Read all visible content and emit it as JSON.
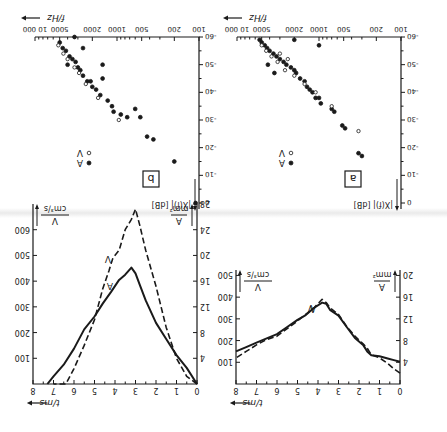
{
  "figure": {
    "orientation": "rotated 180 degrees",
    "background": "#ffffff",
    "ink": "#1a1a1a"
  },
  "chart_data": [
    {
      "id": "time-left",
      "type": "line",
      "panel_position_upright": "top-left",
      "xlabel": "t/ms",
      "x_ticks": [
        0,
        1,
        2,
        3,
        4,
        5,
        6,
        7,
        8
      ],
      "xlim": [
        0,
        8
      ],
      "y_left_label": "A / mm²",
      "y_left_ticks": [
        4,
        8,
        12,
        16,
        20
      ],
      "y_left_lim": [
        0,
        21
      ],
      "y_right_label": "V / cm³/s",
      "y_right_ticks": [
        100,
        200,
        300,
        400,
        500
      ],
      "y_right_lim": [
        0,
        525
      ],
      "series": [
        {
          "name": "A",
          "style": "solid",
          "x": [
            0,
            0.3,
            0.6,
            1,
            1.4,
            1.6,
            1.8,
            2.2,
            2.6,
            3.0,
            3.4,
            3.6,
            3.8,
            4.2,
            4.6,
            5,
            5.5,
            6,
            6.5,
            7,
            7.5,
            8
          ],
          "y": [
            4.1,
            4.4,
            4.7,
            5.1,
            5.3,
            6,
            7.2,
            8.5,
            10.5,
            12.6,
            13.6,
            14.8,
            15,
            14,
            12.7,
            11.8,
            10.5,
            9.2,
            8.4,
            7.6,
            6.8,
            6.0
          ]
        },
        {
          "name": "V",
          "style": "dashed",
          "x": [
            0,
            0.3,
            0.6,
            1,
            1.4,
            1.6,
            1.8,
            2.2,
            2.6,
            3.0,
            3.4,
            3.6,
            3.8,
            4.2,
            4.6,
            5,
            5.5,
            6,
            6.5,
            7,
            7.5,
            8
          ],
          "y": [
            50,
            70,
            95,
            120,
            135,
            165,
            185,
            220,
            265,
            320,
            350,
            375,
            390,
            350,
            320,
            290,
            255,
            220,
            205,
            180,
            150,
            120
          ]
        }
      ],
      "legend": [
        "A",
        "V"
      ]
    },
    {
      "id": "time-right",
      "type": "line",
      "panel_position_upright": "top-right",
      "xlabel": "t/ms",
      "x_ticks": [
        0,
        1,
        2,
        3,
        4,
        5,
        6,
        7,
        8
      ],
      "xlim": [
        0,
        8
      ],
      "y_left_label": "A / mm²",
      "y_left_ticks": [
        4,
        8,
        12,
        16,
        20,
        24,
        28
      ],
      "y_left_lim": [
        0,
        28
      ],
      "y_right_label": "V / cm³/s",
      "y_right_ticks": [
        100,
        200,
        300,
        400,
        500,
        600
      ],
      "y_right_lim": [
        0,
        700
      ],
      "series": [
        {
          "name": "A",
          "style": "solid",
          "x": [
            0,
            0.5,
            1,
            1.5,
            2,
            2.5,
            2.8,
            3.0,
            3.2,
            3.5,
            3.8,
            4.2,
            4.6,
            5,
            5.5,
            6,
            6.5,
            7,
            7.3
          ],
          "y": [
            0,
            2.5,
            4.5,
            7,
            9.5,
            13,
            15.5,
            17.2,
            18.1,
            17,
            16.2,
            14.3,
            12.5,
            10.5,
            8.5,
            5.5,
            3,
            1.2,
            0
          ]
        },
        {
          "name": "V",
          "style": "dashed",
          "x": [
            0,
            0.5,
            1,
            1.5,
            2,
            2.5,
            2.8,
            3.0,
            3.2,
            3.5,
            3.8,
            4.1,
            4.3,
            4.6,
            5,
            5.5,
            6,
            6.4,
            7
          ],
          "y": [
            0,
            30,
            100,
            220,
            380,
            520,
            620,
            680,
            640,
            600,
            520,
            490,
            440,
            370,
            250,
            150,
            60,
            0,
            0
          ]
        }
      ],
      "legend": [
        "A",
        "V"
      ]
    },
    {
      "id": "spectrum-a",
      "type": "scatter",
      "panel_label": "a",
      "panel_position_upright": "bottom-left",
      "xlabel": "f/Hz",
      "xscale": "log",
      "x_ticks": [
        100,
        200,
        500,
        1000,
        2000,
        5000,
        10000
      ],
      "xlim": [
        100,
        10000
      ],
      "ylabel": "|X(f)| [dB]",
      "y_ticks": [
        0,
        -10,
        -20,
        -30,
        -40,
        -50,
        -60
      ],
      "ylim": [
        0,
        -60
      ],
      "legend": [
        {
          "marker": "filled",
          "label": "A"
        },
        {
          "marker": "open",
          "label": "V"
        }
      ],
      "series": [
        {
          "name": "A",
          "marker": "filled",
          "points": [
            [
              300,
              -17
            ],
            [
              330,
              -18
            ],
            [
              480,
              -27
            ],
            [
              520,
              -28
            ],
            [
              650,
              -33
            ],
            [
              700,
              -34
            ],
            [
              950,
              -36
            ],
            [
              1000,
              -38
            ],
            [
              1100,
              -38
            ],
            [
              1200,
              -40
            ],
            [
              1300,
              -41
            ],
            [
              1400,
              -42
            ],
            [
              1500,
              -44
            ],
            [
              1700,
              -45
            ],
            [
              1900,
              -47
            ],
            [
              2000,
              -48
            ],
            [
              2200,
              -49
            ],
            [
              2500,
              -50
            ],
            [
              2700,
              -51
            ],
            [
              3000,
              -52
            ],
            [
              3300,
              -53
            ],
            [
              3600,
              -54
            ],
            [
              4000,
              -55
            ],
            [
              4300,
              -56
            ],
            [
              4600,
              -57
            ],
            [
              5000,
              -58
            ],
            [
              5300,
              -59
            ],
            [
              1000,
              -57
            ],
            [
              2000,
              -59
            ],
            [
              4200,
              -50
            ],
            [
              3500,
              -47
            ]
          ]
        },
        {
          "name": "V",
          "marker": "open",
          "points": [
            [
              330,
              -26
            ],
            [
              700,
              -35
            ],
            [
              1100,
              -40
            ],
            [
              1500,
              -43
            ],
            [
              2000,
              -46
            ],
            [
              2600,
              -48
            ],
            [
              3200,
              -51
            ],
            [
              3800,
              -53
            ],
            [
              4400,
              -55
            ],
            [
              5000,
              -57
            ],
            [
              3000,
              -54
            ],
            [
              2400,
              -52
            ]
          ]
        }
      ]
    },
    {
      "id": "spectrum-b",
      "type": "scatter",
      "panel_label": "b",
      "panel_position_upright": "bottom-right",
      "xlabel": "f/Hz",
      "xscale": "log",
      "x_ticks": [
        100,
        200,
        500,
        1000,
        2000,
        5000,
        10000
      ],
      "xlim": [
        100,
        10000
      ],
      "ylabel": "|X(f)| [dB]",
      "y_ticks": [
        0,
        -10,
        -20,
        -30,
        -40,
        -50,
        -60
      ],
      "ylim": [
        0,
        -60
      ],
      "legend": [
        {
          "marker": "filled",
          "label": "A"
        },
        {
          "marker": "open",
          "label": "V"
        }
      ],
      "series": [
        {
          "name": "A",
          "marker": "filled",
          "points": [
            [
              110,
              0
            ],
            [
              200,
              -15
            ],
            [
              360,
              -23
            ],
            [
              430,
              -24
            ],
            [
              520,
              -31
            ],
            [
              600,
              -34
            ],
            [
              750,
              -31
            ],
            [
              900,
              -32
            ],
            [
              1100,
              -33
            ],
            [
              1150,
              -35
            ],
            [
              1300,
              -37
            ],
            [
              1600,
              -39
            ],
            [
              1800,
              -41
            ],
            [
              2000,
              -42
            ],
            [
              2100,
              -44
            ],
            [
              2300,
              -44
            ],
            [
              1500,
              -45
            ],
            [
              1500,
              -50
            ],
            [
              2600,
              -46
            ],
            [
              2800,
              -48
            ],
            [
              3000,
              -49
            ],
            [
              3200,
              -51
            ],
            [
              3500,
              -52
            ],
            [
              3800,
              -53
            ],
            [
              4200,
              -55
            ],
            [
              4600,
              -56
            ],
            [
              5000,
              -58
            ],
            [
              3300,
              -60
            ],
            [
              2600,
              -56
            ],
            [
              4000,
              -50
            ]
          ]
        },
        {
          "name": "V",
          "marker": "open",
          "points": [
            [
              950,
              -30
            ],
            [
              1700,
              -38
            ],
            [
              2400,
              -43
            ],
            [
              2900,
              -47
            ],
            [
              3300,
              -49
            ],
            [
              4000,
              -52
            ],
            [
              4500,
              -54
            ],
            [
              5200,
              -57
            ]
          ]
        }
      ]
    }
  ]
}
